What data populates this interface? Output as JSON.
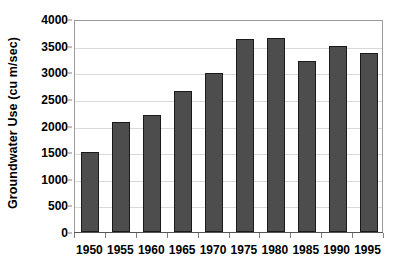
{
  "chart_data": {
    "type": "bar",
    "title": "",
    "xlabel": "",
    "ylabel": "Groundwater Use (cu m/sec)",
    "categories": [
      "1950",
      "1955",
      "1960",
      "1965",
      "1970",
      "1975",
      "1980",
      "1985",
      "1990",
      "1995"
    ],
    "values": [
      1500,
      2070,
      2200,
      2640,
      2990,
      3620,
      3650,
      3220,
      3500,
      3370
    ],
    "series": [
      {
        "name": "Groundwater Use",
        "values": [
          1500,
          2070,
          2200,
          2640,
          2990,
          3620,
          3650,
          3220,
          3500,
          3370
        ]
      }
    ],
    "ylim": [
      0,
      4000
    ],
    "ytick_values": [
      0,
      500,
      1000,
      1500,
      2000,
      2500,
      3000,
      3500,
      4000
    ],
    "ytick_labels": [
      "0",
      "500",
      "1000",
      "1500",
      "2000",
      "2500",
      "3000",
      "3500",
      "4000"
    ],
    "grid": true,
    "grid_axis": "y",
    "legend": false,
    "legend_position": "none",
    "bar_color": "#4d4d4d",
    "bar_edge_color": "#1a1a1a",
    "grid_color": "#d9d9d9",
    "axis_color": "#9a9a9a",
    "background_color": "#ffffff"
  }
}
